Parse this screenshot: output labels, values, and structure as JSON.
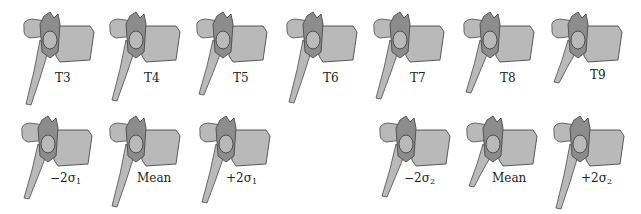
{
  "figure": {
    "top_row": [
      {
        "label": "T3",
        "x": 20,
        "label_x": 55,
        "label_y": 71
      },
      {
        "label": "T4",
        "x": 106,
        "label_x": 144,
        "label_y": 71
      },
      {
        "label": "T5",
        "x": 193,
        "label_x": 233,
        "label_y": 71
      },
      {
        "label": "T6",
        "x": 283,
        "label_x": 323,
        "label_y": 71
      },
      {
        "label": "T7",
        "x": 370,
        "label_x": 410,
        "label_y": 71
      },
      {
        "label": "T8",
        "x": 460,
        "label_x": 500,
        "label_y": 71
      },
      {
        "label": "T9",
        "x": 548,
        "label_x": 590,
        "label_y": 68
      }
    ],
    "bottom_row": [
      {
        "label": "−2σ",
        "sub": "1",
        "x": 18,
        "label_x": 50,
        "label_y": 171
      },
      {
        "label": "Mean",
        "sub": "",
        "x": 106,
        "label_x": 137,
        "label_y": 171
      },
      {
        "label": "+2σ",
        "sub": "1",
        "x": 196,
        "label_x": 226,
        "label_y": 171
      },
      {
        "label": "−2σ",
        "sub": "2",
        "x": 376,
        "label_x": 404,
        "label_y": 171
      },
      {
        "label": "Mean",
        "sub": "",
        "x": 463,
        "label_x": 492,
        "label_y": 171
      },
      {
        "label": "+2σ",
        "sub": "2",
        "x": 550,
        "label_x": 581,
        "label_y": 171
      }
    ],
    "colors": {
      "bone_fill": "#b9b9b9",
      "bone_shade": "#8c8c8c",
      "bone_edge": "#4a4a4a",
      "label": "#222222"
    }
  }
}
